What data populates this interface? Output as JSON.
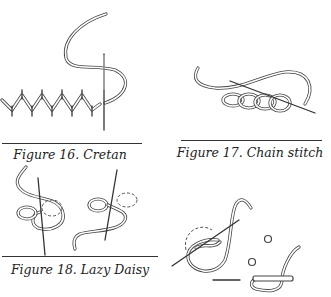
{
  "figures": [
    {
      "id": "16",
      "caption": "Figure 16. Cretan",
      "stitch": "Cretan"
    },
    {
      "id": "17",
      "caption": "Figure 17. Chain stitch",
      "stitch": "Chain stitch"
    },
    {
      "id": "18",
      "caption": "Figure 18. Lazy Daisy",
      "stitch": "Lazy Daisy"
    },
    {
      "id": "19",
      "caption": "",
      "stitch": "French knot"
    }
  ],
  "colors": {
    "line": "#333333",
    "background": "#ffffff"
  }
}
